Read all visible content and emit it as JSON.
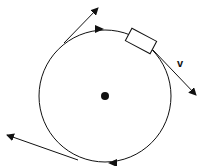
{
  "diagram": {
    "velocity_label": "v",
    "elements": {
      "circle": {
        "cx": 105,
        "cy": 96,
        "r": 66
      },
      "center_dot": {
        "cx": 105,
        "cy": 96,
        "r": 4
      },
      "block": {
        "description": "rectangular object on circle path, upper right"
      },
      "tangent_arrows": [
        {
          "position": "upper-left",
          "direction": "up-right"
        },
        {
          "position": "upper-right",
          "direction": "down-right",
          "label": "v"
        },
        {
          "position": "bottom",
          "direction": "left"
        }
      ],
      "path_direction_arrowheads": [
        "top (pointing right)",
        "bottom (pointing left)"
      ]
    },
    "colors": {
      "stroke": "#111111",
      "background": "#ffffff"
    }
  }
}
